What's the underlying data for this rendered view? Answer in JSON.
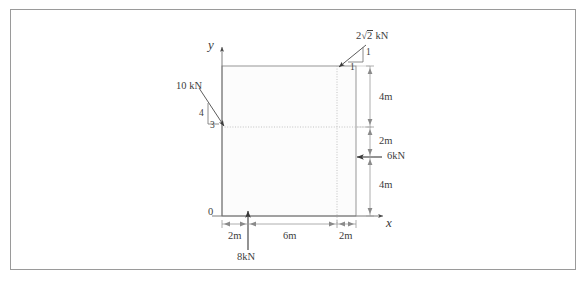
{
  "figure": {
    "type": "engineering-free-body-diagram",
    "axes": {
      "x_label": "x",
      "y_label": "y",
      "origin_label": "0"
    },
    "colors": {
      "line": "#6f6f6f",
      "text": "#404040",
      "border": "#9a9a9a",
      "fill": "#fcfcfc",
      "dotted": "#b0b0b0"
    },
    "loads": [
      {
        "id": "load-top-right",
        "magnitude": "2",
        "radical": "2",
        "unit": "kN",
        "slope_rise": "1",
        "slope_run": "1",
        "direction": "down-left",
        "applied_at": "top edge at x=8m"
      },
      {
        "id": "load-left",
        "magnitude": "10 kN",
        "slope_rise": "4",
        "slope_run": "3",
        "direction": "down-right",
        "applied_at": "left edge at y=4m"
      },
      {
        "id": "load-bottom",
        "magnitude": "8kN",
        "direction": "up",
        "applied_at": "bottom edge at x=2m"
      },
      {
        "id": "load-right",
        "magnitude": "6kN",
        "direction": "left",
        "applied_at": "right edge at y=4m"
      }
    ],
    "dimensions_horizontal": [
      {
        "label": "2m"
      },
      {
        "label": "6m"
      },
      {
        "label": "2m"
      }
    ],
    "dimensions_vertical": [
      {
        "label": "4m"
      },
      {
        "label": "2m"
      },
      {
        "label": "4m"
      }
    ]
  }
}
